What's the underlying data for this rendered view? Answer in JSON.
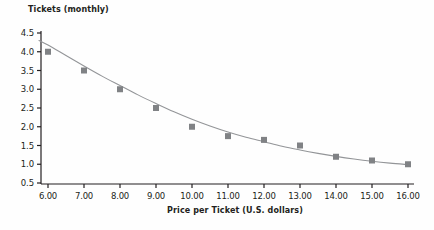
{
  "chart_data": {
    "type": "scatter",
    "title": "",
    "xlabel": "Price per Ticket (U.S. dollars)",
    "ylabel": "Tickets (monthly)",
    "xlim": [
      5.5,
      16.5
    ],
    "ylim": [
      0.5,
      4.5
    ],
    "grid": false,
    "legend": null,
    "x": [
      6.0,
      7.0,
      8.0,
      9.0,
      10.0,
      11.0,
      12.0,
      13.0,
      14.0,
      15.0,
      16.0
    ],
    "values": [
      4.0,
      3.5,
      3.0,
      2.5,
      2.0,
      1.75,
      1.65,
      1.5,
      1.2,
      1.1,
      1.0
    ],
    "xtick_labels": [
      "6.00",
      "7.00",
      "8.00",
      "9.00",
      "10.00",
      "11.00",
      "12.00",
      "13.00",
      "14.00",
      "15.00",
      "16.00"
    ],
    "xtick_values": [
      6,
      7,
      8,
      9,
      10,
      11,
      12,
      13,
      14,
      15,
      16
    ],
    "ytick_labels": [
      "4.5",
      "4.0",
      "3.5",
      "3.0",
      "2.5",
      "2.0",
      "1.5",
      "1.0",
      "0.5"
    ],
    "ytick_values": [
      4.5,
      4.0,
      3.5,
      3.0,
      2.5,
      2.0,
      1.5,
      1.0,
      0.5
    ],
    "fit_curve": {
      "label": "",
      "points": [
        [
          5.75,
          4.3
        ],
        [
          6.0,
          4.18
        ],
        [
          6.5,
          3.9
        ],
        [
          7.0,
          3.62
        ],
        [
          7.5,
          3.35
        ],
        [
          8.0,
          3.1
        ],
        [
          8.5,
          2.85
        ],
        [
          9.0,
          2.62
        ],
        [
          9.5,
          2.4
        ],
        [
          10.0,
          2.2
        ],
        [
          10.5,
          2.02
        ],
        [
          11.0,
          1.86
        ],
        [
          11.5,
          1.72
        ],
        [
          12.0,
          1.6
        ],
        [
          12.5,
          1.48
        ],
        [
          13.0,
          1.38
        ],
        [
          13.5,
          1.29
        ],
        [
          14.0,
          1.21
        ],
        [
          14.5,
          1.14
        ],
        [
          15.0,
          1.08
        ],
        [
          15.5,
          1.03
        ],
        [
          16.0,
          0.99
        ]
      ]
    },
    "marker_color": "#808285",
    "line_color": "#939598",
    "axis_color": "#231f20",
    "text_color": "#231f20",
    "background_color": "#fefefe"
  }
}
